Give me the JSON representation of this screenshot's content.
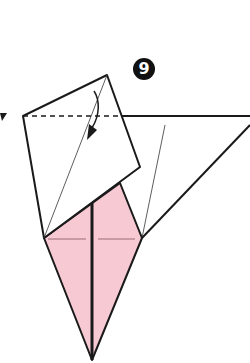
{
  "diagram": {
    "step_number": "9",
    "colors": {
      "paper_white": "#ffffff",
      "paper_pink": "#f6c9d3",
      "line": "#1a1a1a",
      "thin_line": "#333333"
    },
    "elements": {
      "folded_square_flap": "folded-square-flap",
      "pink_kite_base": "pink-kite-base",
      "valley_fold_line": "dashed-valley-fold",
      "fold_arrow": "curved-fold-arrow",
      "side_marker": "left-pointer-arrow"
    }
  }
}
